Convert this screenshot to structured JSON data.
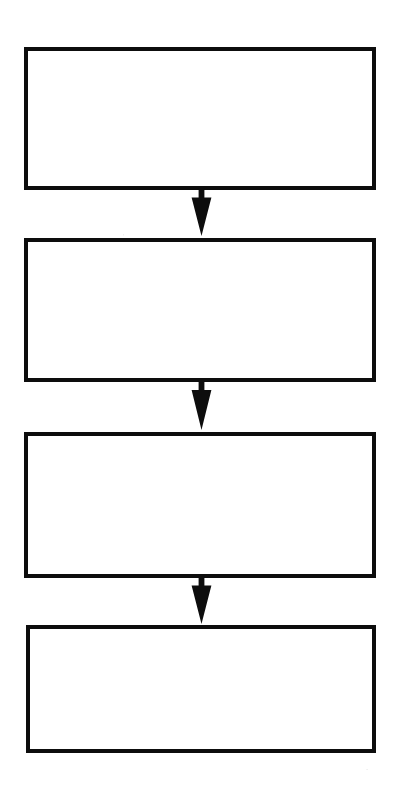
{
  "document": {
    "type": "flowchart",
    "orientation": "vertical",
    "title": "",
    "background_color": "#ffffff",
    "stroke_color": "#000000",
    "width": 399,
    "height": 810
  },
  "diagram": {
    "node_count": 4,
    "connector_count": 3,
    "nodes": [
      {
        "id": "step-1",
        "shape": "rectangle",
        "label": "",
        "x": 24,
        "y": 47,
        "width": 352,
        "height": 143,
        "border_width": 4,
        "border_color": "#0d0d0d",
        "fill_color": "#ffffff"
      },
      {
        "id": "step-2",
        "shape": "rectangle",
        "label": "",
        "x": 24,
        "y": 238,
        "width": 352,
        "height": 144,
        "border_width": 4,
        "border_color": "#0d0d0d",
        "fill_color": "#ffffff"
      },
      {
        "id": "step-3",
        "shape": "rectangle",
        "label": "",
        "x": 24,
        "y": 432,
        "width": 352,
        "height": 146,
        "border_width": 4,
        "border_color": "#0d0d0d",
        "fill_color": "#ffffff"
      },
      {
        "id": "step-4",
        "shape": "rectangle",
        "label": "",
        "x": 26,
        "y": 625,
        "width": 350,
        "height": 128,
        "border_width": 4,
        "border_color": "#0d0d0d",
        "fill_color": "#ffffff"
      }
    ],
    "connectors": [
      {
        "id": "arrow-1",
        "from": "step-1",
        "to": "step-2",
        "direction": "down",
        "label": "",
        "center_x": 201,
        "y": 188,
        "length": 48,
        "head_width": 21,
        "shaft_width": 6,
        "color": "#0d0d0d"
      },
      {
        "id": "arrow-2",
        "from": "step-2",
        "to": "step-3",
        "direction": "down",
        "label": "",
        "center_x": 201,
        "y": 380,
        "length": 50,
        "head_width": 21,
        "shaft_width": 6,
        "color": "#0d0d0d"
      },
      {
        "id": "arrow-3",
        "from": "step-3",
        "to": "step-4",
        "direction": "down",
        "label": "",
        "center_x": 201,
        "y": 576,
        "length": 48,
        "head_width": 21,
        "shaft_width": 6,
        "color": "#0d0d0d"
      }
    ]
  }
}
